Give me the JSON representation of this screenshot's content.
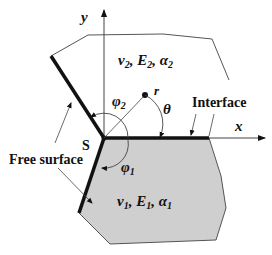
{
  "diagram": {
    "axes": {
      "x_label": "x",
      "y_label": "y"
    },
    "origin_label": "S",
    "polar": {
      "r_label": "r",
      "theta_label": "θ"
    },
    "angles": {
      "phi1": "φ",
      "phi1_sub": "1",
      "phi2": "φ",
      "phi2_sub": "2"
    },
    "labels": {
      "interface": "Interface",
      "free_surface": "Free surface"
    },
    "material_top": {
      "nu": "ν",
      "nu_sub": "2",
      "E": "E",
      "E_sub": "2",
      "alpha": "α",
      "alpha_sub": "2",
      "sep": ","
    },
    "material_bottom": {
      "nu": "ν",
      "nu_sub": "1",
      "E": "E",
      "E_sub": "1",
      "alpha": "α",
      "alpha_sub": "1",
      "sep": ","
    },
    "colors": {
      "bottom_fill": "#cfcfcf",
      "outline": "#555555",
      "thick_line": "#111111",
      "text": "#111111"
    }
  }
}
